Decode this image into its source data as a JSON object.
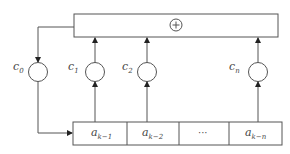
{
  "diagram": {
    "adder": {
      "symbol": "+",
      "icon": "circled-plus-icon"
    },
    "coefficients": [
      {
        "base": "c",
        "sub": "0"
      },
      {
        "base": "c",
        "sub": "1"
      },
      {
        "base": "c",
        "sub": "2"
      },
      {
        "base": "c",
        "sub": "n"
      }
    ],
    "register_cells": [
      {
        "base": "a",
        "sub": "k−1"
      },
      {
        "base": "a",
        "sub": "k−2"
      },
      {
        "base": "",
        "sub": "",
        "text": "···"
      },
      {
        "base": "a",
        "sub": "k−n"
      }
    ]
  }
}
